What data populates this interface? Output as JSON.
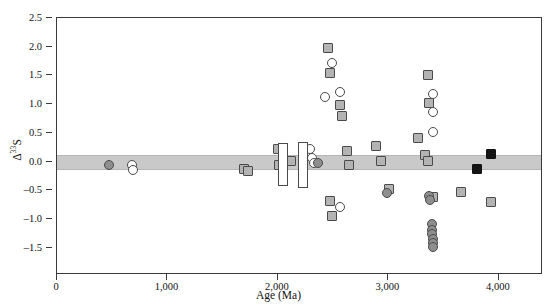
{
  "chart_data": {
    "type": "scatter",
    "title": "",
    "xlabel": "Age (Ma)",
    "ylabel": "Δ33S",
    "ylabel_display": "Δ",
    "ylabel_sup": "33",
    "ylabel_tail": "S",
    "xlim": [
      0,
      4400
    ],
    "ylim": [
      -1.97,
      2.5
    ],
    "xticks": [
      0,
      1000,
      2000,
      3000,
      4000
    ],
    "xticklabels": [
      "0",
      "1,000",
      "2,000",
      "3,000",
      "4,000"
    ],
    "yticks": [
      2.5,
      2.0,
      1.5,
      1.0,
      0.5,
      0.0,
      -0.5,
      -1.0,
      -1.5
    ],
    "yticklabels": [
      "2.5",
      "2.0",
      "1.5",
      "1.0",
      "0.5",
      "0.0",
      "–0.5",
      "–1.0",
      "–1.5"
    ],
    "grid": false,
    "legend": "none",
    "reference_band": {
      "label": "mass-dependent band",
      "ymin": -0.15,
      "ymax": 0.12,
      "color": "#c9c9c9"
    },
    "marker_colors": {
      "grey": "#b3b3b3",
      "dark_grey": "#8e8e8e",
      "white": "#ffffff",
      "black": "#151515",
      "edge": "#4a4a4a"
    },
    "series": [
      {
        "name": "grey squares",
        "marker": "square",
        "fill": "grey",
        "points": [
          [
            1690,
            -0.12
          ],
          [
            1730,
            -0.16
          ],
          [
            2000,
            0.22
          ],
          [
            2010,
            -0.05
          ],
          [
            2120,
            0.02
          ],
          [
            2450,
            1.98
          ],
          [
            2470,
            1.55
          ],
          [
            2560,
            0.98
          ],
          [
            2580,
            0.8
          ],
          [
            2625,
            0.18
          ],
          [
            2640,
            -0.05
          ],
          [
            2470,
            -0.68
          ],
          [
            2490,
            -0.95
          ],
          [
            2890,
            0.28
          ],
          [
            2930,
            0.02
          ],
          [
            3010,
            -0.48
          ],
          [
            3270,
            0.42
          ],
          [
            3330,
            0.12
          ],
          [
            3360,
            0.02
          ],
          [
            3360,
            1.5
          ],
          [
            3370,
            1.02
          ],
          [
            3400,
            -0.62
          ],
          [
            3660,
            -0.52
          ],
          [
            3930,
            -0.7
          ]
        ]
      },
      {
        "name": "white circles",
        "marker": "circle",
        "fill": "white",
        "points": [
          [
            680,
            -0.06
          ],
          [
            690,
            -0.14
          ],
          [
            2290,
            0.22
          ],
          [
            2310,
            0.06
          ],
          [
            2330,
            -0.02
          ],
          [
            2490,
            1.72
          ],
          [
            2430,
            1.12
          ],
          [
            2560,
            1.22
          ],
          [
            2560,
            -0.78
          ],
          [
            3400,
            1.18
          ],
          [
            3400,
            0.86
          ],
          [
            3405,
            0.52
          ]
        ]
      },
      {
        "name": "dark grey circles",
        "marker": "circle",
        "fill": "dark_grey",
        "points": [
          [
            470,
            -0.06
          ],
          [
            2360,
            -0.02
          ],
          [
            2990,
            -0.55
          ],
          [
            3370,
            -0.6
          ],
          [
            3375,
            -0.66
          ],
          [
            3395,
            -1.08
          ],
          [
            3395,
            -1.18
          ],
          [
            3398,
            -1.26
          ],
          [
            3400,
            -1.34
          ],
          [
            3402,
            -1.42
          ],
          [
            3404,
            -1.48
          ]
        ]
      },
      {
        "name": "black squares",
        "marker": "square",
        "fill": "black",
        "points": [
          [
            3800,
            -0.12
          ],
          [
            3930,
            0.14
          ]
        ]
      },
      {
        "name": "white range bars",
        "marker": "bar",
        "fill": "white",
        "bars": [
          {
            "x": 2050,
            "ymin": -0.42,
            "ymax": 0.32,
            "width_ma": 90
          },
          {
            "x": 2230,
            "ymin": -0.46,
            "ymax": 0.34,
            "width_ma": 90
          }
        ]
      }
    ]
  },
  "axis": {
    "x_title": "Age (Ma)",
    "y_title_parts": {
      "head": "Δ",
      "sup": "33",
      "tail": "S"
    }
  }
}
